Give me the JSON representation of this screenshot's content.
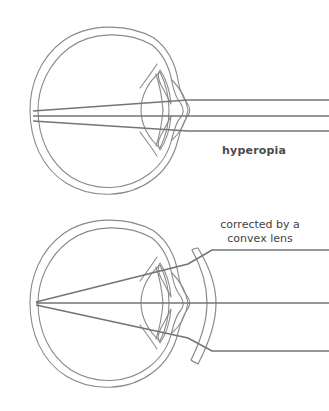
{
  "figure": {
    "width": 329,
    "height": 411,
    "background_color": "#ffffff",
    "outline_color": "#8a8a8a",
    "ray_color": "#757575",
    "text_color": "#4a4a4a"
  },
  "panels": [
    {
      "id": "uncorrected",
      "label": "hyperopia",
      "description": "Cross-section of an eyeball with three parallel light rays entering from the right, refracting through the cornea and lens, and converging behind the retina.",
      "ray_count": 3
    },
    {
      "id": "corrected",
      "label_line_1": "corrected by a",
      "label_line_2": "convex lens",
      "description": "Cross-section of the same eyeball with a convex corrective lens placed in front of it; the three rays now converge to a focal point on the retina.",
      "ray_count": 3
    }
  ],
  "labels": {
    "hyperopia": "hyperopia",
    "corrected_line_1": "corrected by a",
    "corrected_line_2": "convex lens"
  },
  "anatomy_parts": [
    "sclera",
    "cornea",
    "iris",
    "crystalline-lens",
    "retina"
  ]
}
